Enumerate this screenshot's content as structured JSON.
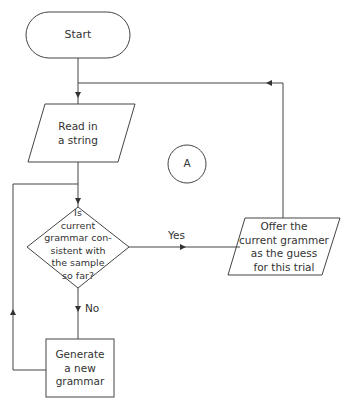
{
  "flowchart": {
    "start": {
      "label": "Start"
    },
    "read": {
      "line1": "Read in",
      "line2": "a string"
    },
    "decision": {
      "lines": [
        "Is",
        "current",
        "grammar con-",
        "sistent with",
        "the sample",
        "so far?"
      ]
    },
    "generate": {
      "line1": "Generate",
      "line2": "a new",
      "line3": "grammar"
    },
    "offer": {
      "line1": "Offer the",
      "line2": "current grammer",
      "line3": "as the guess",
      "line4": "for this trial"
    },
    "connector": {
      "label": "A"
    },
    "edges": {
      "yes": "Yes",
      "no": "No"
    }
  }
}
